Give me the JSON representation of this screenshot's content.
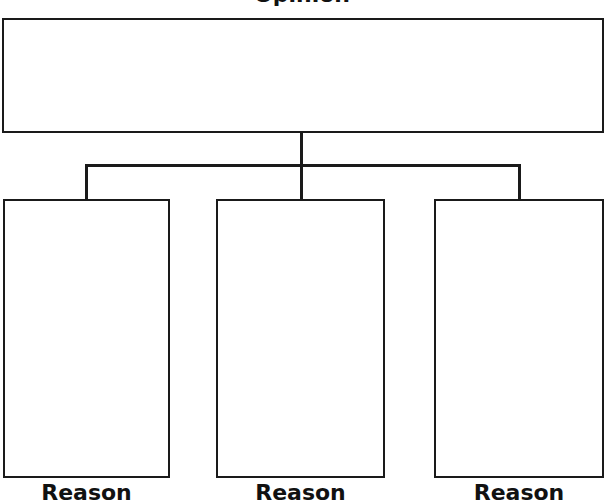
{
  "diagram": {
    "top_label": "Opinion",
    "top_box": {
      "text": ""
    },
    "reasons": [
      {
        "label": "Reason",
        "text": ""
      },
      {
        "label": "Reason",
        "text": ""
      },
      {
        "label": "Reason",
        "text": ""
      }
    ]
  }
}
